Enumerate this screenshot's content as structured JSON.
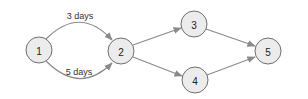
{
  "diagram": {
    "type": "directed-network",
    "background": "#ffffff",
    "node_fill": "#ececec",
    "node_stroke": "#6f6f6f",
    "edge_color": "#8a8a8a",
    "nodes": [
      {
        "id": "1",
        "label": "1",
        "cx": 39,
        "cy": 50,
        "r": 13
      },
      {
        "id": "2",
        "label": "2",
        "cx": 121,
        "cy": 51,
        "r": 13
      },
      {
        "id": "3",
        "label": "3",
        "cx": 194,
        "cy": 24,
        "r": 13
      },
      {
        "id": "4",
        "label": "4",
        "cx": 195,
        "cy": 80,
        "r": 13
      },
      {
        "id": "5",
        "label": "5",
        "cx": 268,
        "cy": 51,
        "r": 13
      }
    ],
    "edges": [
      {
        "from": "1",
        "to": "2",
        "label": "3 days",
        "curve": "up"
      },
      {
        "from": "1",
        "to": "2",
        "label": "5 days",
        "curve": "down"
      },
      {
        "from": "2",
        "to": "3",
        "label": ""
      },
      {
        "from": "2",
        "to": "4",
        "label": ""
      },
      {
        "from": "3",
        "to": "5",
        "label": ""
      },
      {
        "from": "4",
        "to": "5",
        "label": ""
      }
    ],
    "labels": {
      "edge_1_2_top": "3 days",
      "edge_1_2_bottom": "5 days",
      "node_1": "1",
      "node_2": "2",
      "node_3": "3",
      "node_4": "4",
      "node_5": "5"
    }
  }
}
